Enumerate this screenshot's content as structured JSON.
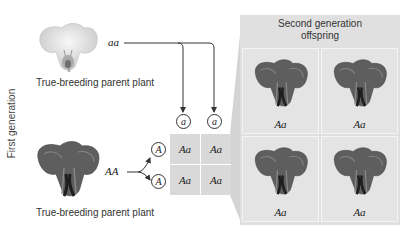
{
  "side_label": "First generation",
  "parents": {
    "recessive": {
      "genotype": "aa",
      "caption": "True-breeding parent plant",
      "flower_color": "white",
      "gametes": [
        "a",
        "a"
      ]
    },
    "dominant": {
      "genotype": "AA",
      "caption": "True-breeding parent plant",
      "flower_color": "purple",
      "gametes": [
        "A",
        "A"
      ]
    }
  },
  "punnett_square": {
    "columns": [
      "a",
      "a"
    ],
    "rows": [
      "A",
      "A"
    ],
    "cells": [
      [
        "Aa",
        "Aa"
      ],
      [
        "Aa",
        "Aa"
      ]
    ]
  },
  "offspring_panel": {
    "title_line1": "Second generation",
    "title_line2": "offspring",
    "offspring": [
      {
        "genotype": "Aa"
      },
      {
        "genotype": "Aa"
      },
      {
        "genotype": "Aa"
      },
      {
        "genotype": "Aa"
      }
    ]
  },
  "colors": {
    "panel_bg": "#e0e0e0",
    "cell_bg": "#d9d9d9",
    "line": "#333333"
  }
}
